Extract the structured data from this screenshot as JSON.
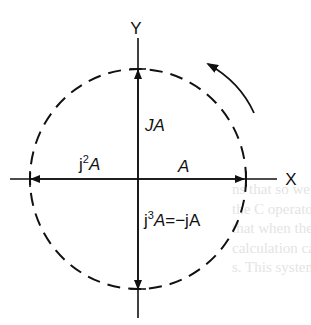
{
  "diagram": {
    "type": "phasor-rotation",
    "axes": {
      "x_label": "X",
      "y_label": "Y"
    },
    "phasors": [
      {
        "id": "A",
        "label_main": "A",
        "direction": "positive-x",
        "angle_deg": 0
      },
      {
        "id": "jA",
        "label_main": "JA",
        "direction": "positive-y",
        "angle_deg": 90
      },
      {
        "id": "j2A",
        "label_prefix": "j",
        "label_sup": "2",
        "label_main": "A",
        "direction": "negative-x",
        "angle_deg": 180
      },
      {
        "id": "j3A",
        "label_prefix": "j",
        "label_sup": "3",
        "label_main": "A",
        "label_suffix": "=−jA",
        "direction": "negative-y",
        "angle_deg": 270
      }
    ],
    "locus": {
      "shape": "circle",
      "style": "dashed"
    },
    "rotation_indicator": {
      "direction": "counter-clockwise"
    }
  },
  "colors": {
    "ink": "#111111",
    "background": "#ffffff",
    "bleed_text": "#e4e4e4"
  },
  "background_bleed_text": [
    "ns that so we can",
    "the C operator",
    "that when these are",
    "calculation can be",
    "s. This system"
  ]
}
